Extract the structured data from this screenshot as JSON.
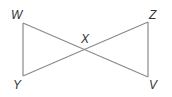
{
  "diagram": {
    "type": "geometry",
    "stroke_color": "#8a8a8a",
    "label_color": "#333333",
    "points": {
      "W": {
        "label": "W",
        "x": 23,
        "y": 23
      },
      "Y": {
        "label": "Y",
        "x": 23,
        "y": 76
      },
      "Z": {
        "label": "Z",
        "x": 148,
        "y": 22
      },
      "V": {
        "label": "V",
        "x": 148,
        "y": 77
      },
      "X": {
        "label": "X",
        "x": 85,
        "y": 49
      }
    },
    "segments": [
      {
        "from": "W",
        "to": "Y"
      },
      {
        "from": "W",
        "to": "V"
      },
      {
        "from": "Y",
        "to": "Z"
      },
      {
        "from": "Z",
        "to": "V"
      }
    ]
  }
}
